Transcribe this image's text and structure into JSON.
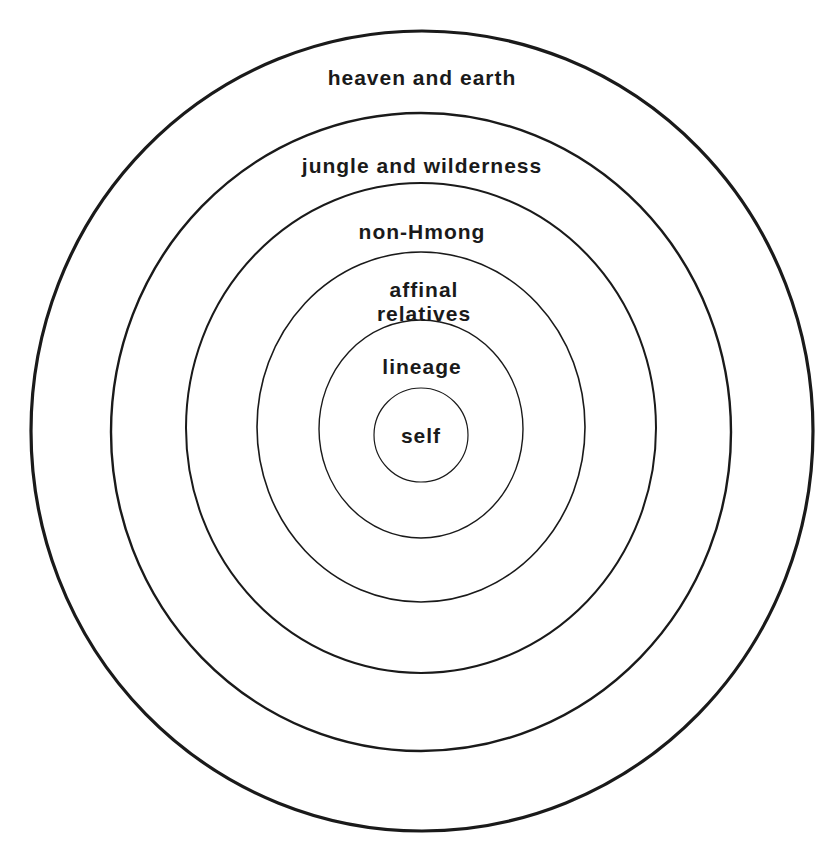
{
  "diagram": {
    "type": "concentric-circles",
    "rings": [
      {
        "label": "heaven and earth",
        "cx": 422,
        "cy": 431,
        "rx": 391,
        "ry": 400,
        "stroke": 3.2,
        "label_y": 64
      },
      {
        "label": "jungle and wilderness",
        "cx": 421,
        "cy": 432,
        "rx": 310,
        "ry": 319,
        "stroke": 2.4,
        "label_y": 153
      },
      {
        "label": "non-Hmong",
        "cx": 421,
        "cy": 428,
        "rx": 235,
        "ry": 245,
        "stroke": 2,
        "label_y": 219
      },
      {
        "label": "affinal\nrelatives",
        "lines": [
          "affinal",
          "relatives"
        ],
        "cx": 421,
        "cy": 427,
        "rx": 164,
        "ry": 175,
        "stroke": 1.6,
        "label_y": 277
      },
      {
        "label": "lineage",
        "cx": 421,
        "cy": 429,
        "rx": 102,
        "ry": 109,
        "stroke": 1.4,
        "label_y": 354
      },
      {
        "label": "self",
        "cx": 421,
        "cy": 435,
        "rx": 47,
        "ry": 47,
        "stroke": 1.2,
        "label_y": 423
      }
    ],
    "stroke_color": "#1a1a1a",
    "background": "#ffffff"
  }
}
